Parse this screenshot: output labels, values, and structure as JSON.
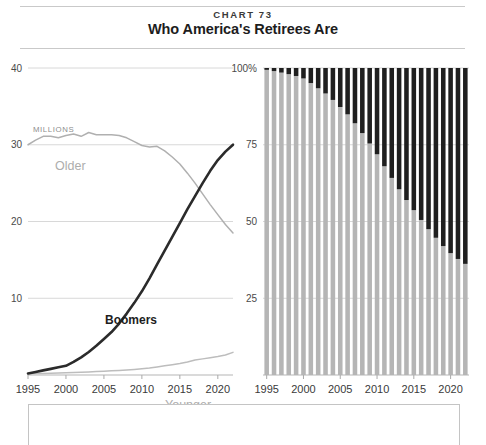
{
  "header": {
    "chart_number": "CHART 73",
    "title": "Who America's Retirees Are"
  },
  "left_panel": {
    "unit_label": "MILLIONS",
    "y_ticks": [
      "40",
      "30",
      "20",
      "10"
    ],
    "x_ticks": [
      "1995",
      "2000",
      "2005",
      "2010",
      "2015",
      "2020"
    ],
    "series_labels": {
      "older": "Older",
      "boomers": "Boomers",
      "younger": "Younger"
    }
  },
  "right_panel": {
    "y_ticks": [
      "100%",
      "75",
      "50",
      "25"
    ],
    "x_ticks": [
      "1995",
      "2000",
      "2005",
      "2010",
      "2015",
      "2020"
    ]
  },
  "colors": {
    "boomers_dark": "#2b2b2b",
    "older_gray": "#b0b0b0",
    "younger_gray": "#bdbdbd",
    "bar_gray": "#b5b5b5",
    "bar_dark": "#1f1f1f",
    "gridline": "#d8d8d8",
    "rule": "#c9c9c9"
  },
  "chart_data": [
    {
      "type": "line",
      "title": "Who America's Retirees Are",
      "xlabel": "",
      "ylabel": "MILLIONS",
      "xlim": [
        1995,
        2022
      ],
      "ylim": [
        0,
        40
      ],
      "grid": true,
      "legend": "inline-labels",
      "x": [
        1995,
        1996,
        1997,
        1998,
        1999,
        2000,
        2001,
        2002,
        2003,
        2004,
        2005,
        2006,
        2007,
        2008,
        2009,
        2010,
        2011,
        2012,
        2013,
        2014,
        2015,
        2016,
        2017,
        2018,
        2019,
        2020,
        2021,
        2022
      ],
      "series": [
        {
          "name": "Older",
          "color": "#b0b0b0",
          "values": [
            30.0,
            30.6,
            31.1,
            31.1,
            30.9,
            31.2,
            31.4,
            31.1,
            31.6,
            31.3,
            31.3,
            31.3,
            31.2,
            30.9,
            30.4,
            29.9,
            29.7,
            29.8,
            29.2,
            28.4,
            27.5,
            26.3,
            25.0,
            23.6,
            22.2,
            20.9,
            19.6,
            18.5
          ]
        },
        {
          "name": "Boomers",
          "color": "#2b2b2b",
          "values": [
            0.2,
            0.4,
            0.6,
            0.8,
            1.0,
            1.2,
            1.7,
            2.3,
            3.0,
            3.8,
            4.7,
            5.6,
            6.7,
            8.0,
            9.4,
            10.9,
            12.6,
            14.4,
            16.2,
            18.0,
            19.8,
            21.6,
            23.3,
            25.0,
            26.6,
            28.0,
            29.1,
            30.0
          ]
        },
        {
          "name": "Younger",
          "color": "#bdbdbd",
          "values": [
            0.15,
            0.18,
            0.2,
            0.22,
            0.25,
            0.28,
            0.32,
            0.36,
            0.4,
            0.45,
            0.5,
            0.55,
            0.6,
            0.65,
            0.72,
            0.8,
            0.9,
            1.05,
            1.2,
            1.35,
            1.5,
            1.7,
            1.95,
            2.1,
            2.25,
            2.4,
            2.6,
            2.95
          ]
        }
      ]
    },
    {
      "type": "bar",
      "stacked": true,
      "percent": true,
      "xlabel": "",
      "ylabel": "",
      "ylim": [
        0,
        100
      ],
      "grid": true,
      "categories": [
        1995,
        1996,
        1997,
        1998,
        1999,
        2000,
        2001,
        2002,
        2003,
        2004,
        2005,
        2006,
        2007,
        2008,
        2009,
        2010,
        2011,
        2012,
        2013,
        2014,
        2015,
        2016,
        2017,
        2018,
        2019,
        2020,
        2021,
        2022
      ],
      "series": [
        {
          "name": "Older and Younger",
          "color": "#b5b5b5",
          "values": [
            99.4,
            99.0,
            98.5,
            98.0,
            97.4,
            96.6,
            95.1,
            93.4,
            91.7,
            89.6,
            87.3,
            84.9,
            82.0,
            78.8,
            75.4,
            71.9,
            68.0,
            64.2,
            60.5,
            57.0,
            53.7,
            50.5,
            47.5,
            44.7,
            42.0,
            39.7,
            37.8,
            36.2
          ]
        },
        {
          "name": "Boomers",
          "color": "#1f1f1f",
          "values": [
            0.6,
            1.0,
            1.5,
            2.0,
            2.6,
            3.4,
            4.9,
            6.6,
            8.3,
            10.4,
            12.7,
            15.1,
            18.0,
            21.2,
            24.6,
            28.1,
            32.0,
            35.8,
            39.5,
            43.0,
            46.3,
            49.5,
            52.5,
            55.3,
            58.0,
            60.3,
            62.2,
            63.8
          ]
        }
      ]
    }
  ]
}
